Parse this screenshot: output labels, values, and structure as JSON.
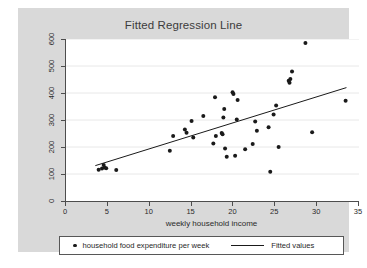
{
  "chart_data": {
    "type": "scatter",
    "title": "Fitted Regression Line",
    "xlabel": "weekly household income",
    "ylabel": "",
    "xlim": [
      0,
      35
    ],
    "ylim": [
      0,
      600
    ],
    "xticks": [
      0,
      5,
      10,
      15,
      20,
      25,
      30,
      35
    ],
    "yticks": [
      0,
      100,
      200,
      300,
      400,
      500,
      600
    ],
    "grid": "horizontal",
    "legend_position": "bottom",
    "colors": {
      "marker": "#1a1a1a",
      "line": "#1a1a1a",
      "panel_background": "#d9d9d9",
      "plot_background": "#ffffff",
      "axis": "#4d4d4d",
      "gridline": "#e8e8e8"
    },
    "series": [
      {
        "name": "household food expenditure per week",
        "type": "scatter",
        "marker": "circle",
        "points": [
          [
            3.9,
            116
          ],
          [
            4.3,
            120
          ],
          [
            4.5,
            133
          ],
          [
            4.6,
            124
          ],
          [
            4.8,
            121
          ],
          [
            6.0,
            115
          ],
          [
            12.4,
            186
          ],
          [
            12.8,
            241
          ],
          [
            14.2,
            265
          ],
          [
            14.4,
            253
          ],
          [
            15.0,
            296
          ],
          [
            15.2,
            235
          ],
          [
            16.4,
            315
          ],
          [
            17.6,
            213
          ],
          [
            17.8,
            384
          ],
          [
            17.9,
            241
          ],
          [
            18.6,
            252
          ],
          [
            18.7,
            247
          ],
          [
            18.8,
            309
          ],
          [
            18.9,
            341
          ],
          [
            19.0,
            194
          ],
          [
            19.2,
            164
          ],
          [
            19.9,
            403
          ],
          [
            20.0,
            396
          ],
          [
            20.2,
            168
          ],
          [
            20.4,
            302
          ],
          [
            20.5,
            374
          ],
          [
            21.4,
            192
          ],
          [
            22.3,
            211
          ],
          [
            22.6,
            294
          ],
          [
            22.8,
            260
          ],
          [
            24.2,
            273
          ],
          [
            24.4,
            108
          ],
          [
            24.8,
            320
          ],
          [
            25.1,
            354
          ],
          [
            25.4,
            200
          ],
          [
            26.6,
            445
          ],
          [
            26.7,
            438
          ],
          [
            26.8,
            452
          ],
          [
            27.0,
            480
          ],
          [
            28.6,
            585
          ],
          [
            29.4,
            255
          ],
          [
            33.4,
            371
          ]
        ]
      },
      {
        "name": "Fitted values",
        "type": "line",
        "endpoints": [
          [
            3.5,
            131
          ],
          [
            33.5,
            420
          ]
        ]
      }
    ]
  },
  "legend": {
    "entries": [
      {
        "label": "household food expenditure per week",
        "marker": "dot"
      },
      {
        "label": "Fitted values",
        "marker": "line"
      }
    ]
  },
  "axis": {
    "x_tick_labels": [
      "0",
      "5",
      "10",
      "15",
      "20",
      "25",
      "30",
      "35"
    ],
    "y_tick_labels": [
      "0",
      "100",
      "200",
      "300",
      "400",
      "500",
      "600"
    ]
  }
}
